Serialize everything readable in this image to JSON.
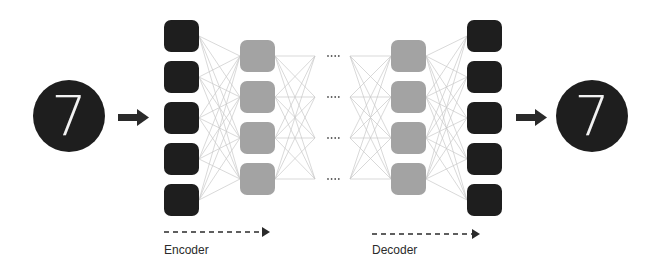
{
  "diagram": {
    "input": {
      "digit": "7"
    },
    "output": {
      "digit": "7"
    },
    "encoder_label": "Encoder",
    "decoder_label": "Decoder",
    "ellipsis": "····",
    "layers": [
      {
        "name": "input-layer",
        "nodes": 5,
        "color": "#1e1e1e"
      },
      {
        "name": "encoder-hidden",
        "nodes": 4,
        "color": "#a3a3a3"
      },
      {
        "name": "bottleneck-junction-left",
        "nodes": 4,
        "color": "none"
      },
      {
        "name": "bottleneck-junction-right",
        "nodes": 4,
        "color": "none"
      },
      {
        "name": "decoder-hidden",
        "nodes": 4,
        "color": "#a3a3a3"
      },
      {
        "name": "output-layer",
        "nodes": 5,
        "color": "#1e1e1e"
      }
    ],
    "colors": {
      "dark_node": "#1e1e1e",
      "light_node": "#a3a3a3",
      "edge": "#c8c8c8",
      "arrow": "#2a2a2a",
      "text": "#2b2b2b",
      "digit": "#ffffff"
    }
  }
}
